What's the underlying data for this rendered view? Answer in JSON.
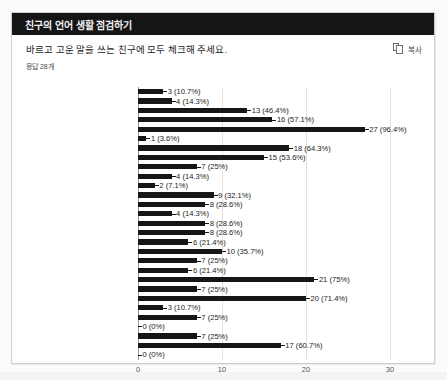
{
  "card": {
    "header_title": "친구의 언어 생활 점검하기",
    "question": "바르고 고운 말을 쓰는 친구에 모두 체크해 주세요.",
    "response_count": "응답 28개",
    "copy_label": "복사",
    "copy_icon": "copy-icon"
  },
  "chart_data": {
    "type": "bar",
    "orientation": "horizontal",
    "title": "바르고 고운 말을 쓰는 친구에 모두 체크해 주세요.",
    "subtitle": "응답 28개",
    "xlabel": "",
    "ylabel": "",
    "xlim": [
      0,
      32
    ],
    "xticks": [
      0,
      10,
      20,
      30
    ],
    "xtick_labels": [
      "0",
      "10",
      "20",
      "30"
    ],
    "grid": true,
    "legend": false,
    "total_responses": 28,
    "bar_color": "#161616",
    "categories": [
      "항목 1",
      "항목 2",
      "항목 3",
      "항목 4",
      "항목 5",
      "항목 6",
      "항목 7",
      "항목 8",
      "항목 9",
      "항목 10",
      "항목 11",
      "항목 12",
      "항목 13",
      "항목 14",
      "항목 15",
      "항목 16",
      "항목 17",
      "항목 18",
      "항목 19",
      "항목 20",
      "항목 21",
      "항목 22",
      "항목 23",
      "항목 24",
      "항목 25",
      "항목 26",
      "항목 27",
      "항목 28",
      "항목 29"
    ],
    "values": [
      3,
      4,
      13,
      16,
      27,
      1,
      18,
      15,
      7,
      4,
      2,
      9,
      8,
      4,
      8,
      8,
      6,
      10,
      7,
      6,
      21,
      7,
      20,
      3,
      7,
      0,
      7,
      17,
      0
    ],
    "percentages": [
      "10.7%",
      "14.3%",
      "46.4%",
      "57.1%",
      "96.4%",
      "3.6%",
      "64.3%",
      "53.6%",
      "25%",
      "14.3%",
      "7.1%",
      "32.1%",
      "28.6%",
      "14.3%",
      "28.6%",
      "28.6%",
      "21.4%",
      "35.7%",
      "25%",
      "21.4%",
      "75%",
      "25%",
      "71.4%",
      "10.7%",
      "25%",
      "0%",
      "25%",
      "60.7%",
      "0%"
    ],
    "data_labels": [
      "3 (10.7%)",
      "4 (14.3%)",
      "13 (46.4%)",
      "16 (57.1%)",
      "27 (96.4%)",
      "1 (3.6%)",
      "18 (64.3%)",
      "15 (53.6%)",
      "7 (25%)",
      "4 (14.3%)",
      "2 (7.1%)",
      "9 (32.1%)",
      "8 (28.6%)",
      "4 (14.3%)",
      "8 (28.6%)",
      "8 (28.6%)",
      "6 (21.4%)",
      "10 (35.7%)",
      "7 (25%)",
      "6 (21.4%)",
      "21 (75%)",
      "7 (25%)",
      "20 (71.4%)",
      "3 (10.7%)",
      "7 (25%)",
      "0 (0%)",
      "7 (25%)",
      "17 (60.7%)",
      "0 (0%)"
    ]
  }
}
